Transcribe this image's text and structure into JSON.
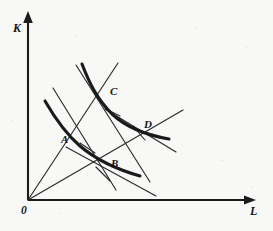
{
  "figure": {
    "background_color": "#f8f8f7",
    "ink_color": "#1a1a1a",
    "width": 273,
    "height": 231
  },
  "axes": {
    "vertical": {
      "label": "K",
      "name": "capital",
      "label_x": 13,
      "label_y": 22,
      "arrow": "up-arrow-icon"
    },
    "horizontal": {
      "label": "L",
      "name": "labor",
      "label_x": 250,
      "label_y": 208,
      "arrow": "right-arrow-icon"
    },
    "origin": {
      "label": "0",
      "label_x": 22,
      "label_y": 208
    }
  },
  "points": [
    {
      "id": "A",
      "label": "A",
      "x": 77,
      "y": 142,
      "label_x": 61,
      "label_y": 134
    },
    {
      "id": "B",
      "label": "B",
      "x": 103,
      "y": 170,
      "label_x": 111,
      "label_y": 158
    },
    {
      "id": "C",
      "label": "C",
      "x": 103,
      "y": 97,
      "label_x": 110,
      "label_y": 86
    },
    {
      "id": "D",
      "label": "D",
      "x": 142,
      "y": 131,
      "label_x": 144,
      "label_y": 119
    }
  ],
  "isoquants": [
    {
      "name": "inner-isoquant",
      "description": "lower output isoquant passing through A and B",
      "path": "M 45,101 C 56,120 66,134 80,146 C 94,158 112,168 140,176"
    },
    {
      "name": "outer-isoquant",
      "description": "higher output isoquant passing through C and D",
      "path": "M 82,64 C 90,85 98,100 112,114 C 127,128 146,135 169,139"
    }
  ],
  "rays": [
    {
      "name": "expansion-path-steep",
      "description": "ray from origin through A and C",
      "x1": 28,
      "y1": 200,
      "x2": 118,
      "y2": 63
    },
    {
      "name": "expansion-path-flat",
      "description": "ray from origin through B and D",
      "x1": 28,
      "y1": 200,
      "x2": 183,
      "y2": 110
    }
  ],
  "isocosts": [
    {
      "name": "isocost-through-A",
      "description": "budget line tangent at A",
      "x1": 53,
      "y1": 88,
      "x2": 116,
      "y2": 190
    },
    {
      "name": "isocost-through-C",
      "description": "budget line tangent at C",
      "x1": 76,
      "y1": 65,
      "x2": 150,
      "y2": 182
    },
    {
      "name": "isocost-through-B",
      "description": "budget line tangent at B",
      "x1": 66,
      "y1": 147,
      "x2": 156,
      "y2": 196
    },
    {
      "name": "isocost-through-D",
      "description": "budget line tangent at D",
      "x1": 105,
      "y1": 109,
      "x2": 176,
      "y2": 152
    }
  ],
  "tangent_stubs": [
    {
      "name": "tangent-stub-A",
      "x1": 80,
      "y1": 143,
      "x2": 95,
      "y2": 153
    },
    {
      "name": "tangent-stub-C",
      "x1": 106,
      "y1": 109,
      "x2": 120,
      "y2": 116
    },
    {
      "name": "tangent-stub-B",
      "x1": 96,
      "y1": 167,
      "x2": 110,
      "y2": 181
    },
    {
      "name": "tangent-stub-D",
      "x1": 133,
      "y1": 126,
      "x2": 145,
      "y2": 140
    }
  ]
}
